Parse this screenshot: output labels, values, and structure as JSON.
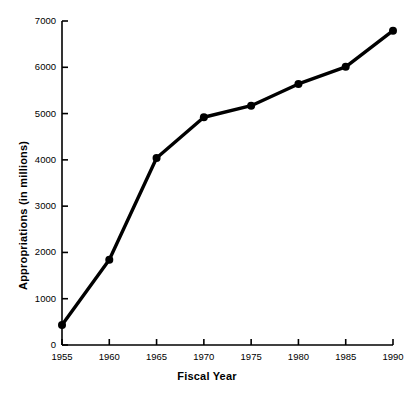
{
  "chart_data": {
    "type": "line",
    "title": "",
    "subtitle": "",
    "xlabel": "Fiscal Year",
    "ylabel": "Appropriations (in millions)",
    "x": [
      1955,
      1960,
      1965,
      1970,
      1975,
      1980,
      1985,
      1990
    ],
    "values": [
      430,
      1840,
      4040,
      4920,
      5170,
      5640,
      6010,
      6790
    ],
    "series": [
      {
        "name": "Appropriations",
        "values": [
          430,
          1840,
          4040,
          4920,
          5170,
          5640,
          6010,
          6790
        ]
      }
    ],
    "xlim": [
      1955,
      1990
    ],
    "ylim": [
      0,
      7000
    ],
    "xticks": [
      1955,
      1960,
      1965,
      1970,
      1975,
      1980,
      1985,
      1990
    ],
    "yticks": [
      0,
      1000,
      2000,
      3000,
      4000,
      5000,
      6000,
      7000
    ],
    "xtick_labels": [
      "1955",
      "1960",
      "1965",
      "1970",
      "1975",
      "1980",
      "1985",
      "1990"
    ],
    "ytick_labels": [
      "0",
      "1000",
      "2000",
      "3000",
      "4000",
      "5000",
      "6000",
      "7000"
    ],
    "grid": false,
    "legend": false,
    "legend_position": "none",
    "line_color": "#000000",
    "marker_color": "#000000",
    "marker_style": "circle",
    "background_color": "#ffffff",
    "axis_color": "#000000"
  }
}
